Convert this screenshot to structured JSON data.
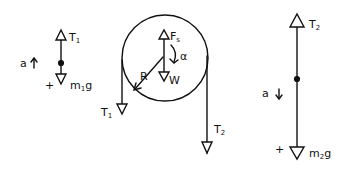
{
  "diagram": {
    "title": "",
    "mass1": {
      "tension_label": "T",
      "tension_sub": "1",
      "weight_label": "m",
      "weight_sub": "1",
      "weight_suffix": "g",
      "accel_label": "a",
      "sign_label": "+"
    },
    "pulley": {
      "force_label": "F",
      "force_sub": "s",
      "weight_label": "W",
      "alpha_label": "α",
      "radius_label": "R",
      "left_tension_label": "T",
      "left_tension_sub": "1",
      "right_tension_label": "T",
      "right_tension_sub": "2"
    },
    "mass2": {
      "tension_label": "T",
      "tension_sub": "2",
      "weight_label": "m",
      "weight_sub": "2",
      "weight_suffix": "g",
      "accel_label": "a",
      "sign_label": "+"
    },
    "colors": {
      "ink": "#111111",
      "background": "#ffffff"
    }
  }
}
